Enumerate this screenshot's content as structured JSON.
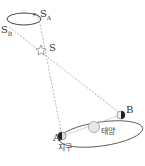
{
  "diagram": {
    "labels": {
      "star_apparent_a": {
        "main": "S",
        "sub": "A"
      },
      "star_apparent_b": {
        "main": "S",
        "sub": "B"
      },
      "star": "S",
      "earth_pos_a": "A",
      "earth_pos_b": "B",
      "sun": "태양",
      "earth": "지구"
    },
    "colors": {
      "line": "#888888",
      "orbit": "#555555",
      "sun": "#e0e0e0",
      "earth_dark": "#222222"
    }
  }
}
